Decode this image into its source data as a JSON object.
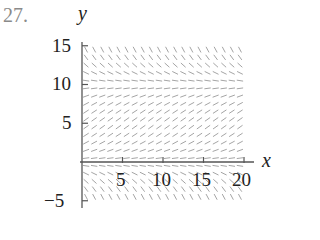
{
  "problem": {
    "number": "27."
  },
  "chart_data": {
    "type": "direction-field",
    "title": "",
    "xlabel": "x",
    "ylabel": "y",
    "xlim": [
      0,
      20
    ],
    "ylim": [
      -5,
      15
    ],
    "x_ticks": [
      "5",
      "10",
      "15",
      "20"
    ],
    "y_ticks": [
      "15",
      "10",
      "5",
      "−5"
    ],
    "grid": false,
    "equilibria": [
      0,
      10
    ],
    "slope_behavior": {
      "above_10": "negative (steeper as y increases)",
      "between_0_and_10": "positive",
      "below_0": "negative (steeper as y decreases)"
    },
    "slope_model": "dy/dx = 0.03*y*(10 - y)",
    "field_x_range": [
      0,
      20
    ],
    "field_y_range": [
      -4.5,
      15
    ]
  },
  "colors": {
    "axis": "#555555",
    "segments": "#9a9a9a",
    "text": "#222222",
    "number": "#8a8a8a"
  }
}
